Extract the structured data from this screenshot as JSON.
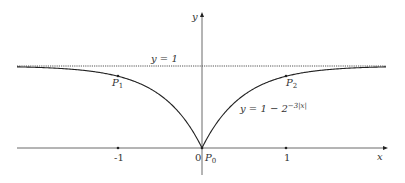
{
  "figure": {
    "axes": {
      "x_label": "x",
      "y_label": "y"
    },
    "asymptote_label": "y = 1",
    "curve_label": {
      "prefix": "y = 1 − 2",
      "exponent": "−3|x|"
    },
    "tick_labels": {
      "neg_one": "-1",
      "zero": "0",
      "one": "1"
    },
    "points": [
      {
        "name": "P",
        "sub": "1",
        "x": -1,
        "y": 0.875
      },
      {
        "name": "P",
        "sub": "2",
        "x": 1,
        "y": 0.875
      },
      {
        "name": "P",
        "sub": "0",
        "x": 0,
        "y": 0
      }
    ],
    "colors": {
      "curve": "#222222",
      "axis": "#444444",
      "asymptote": "#555555"
    }
  },
  "chart_data": {
    "type": "line",
    "title": "",
    "xlabel": "x",
    "ylabel": "y",
    "function": "y = 1 - 2^(-3|x|)",
    "asymptote": {
      "y": 1,
      "label": "y = 1",
      "style": "dotted"
    },
    "xlim": [
      -2.2,
      2.2
    ],
    "ylim": [
      0,
      1.6
    ],
    "x_ticks": [
      -1,
      0,
      1
    ],
    "series": [
      {
        "name": "y = 1 - 2^{-3|x|}",
        "x": [
          -2.2,
          -2,
          -1.5,
          -1,
          -0.75,
          -0.5,
          -0.25,
          0,
          0.25,
          0.5,
          0.75,
          1,
          1.5,
          2,
          2.2
        ],
        "values": [
          0.99,
          0.984,
          0.956,
          0.875,
          0.79,
          0.646,
          0.405,
          0,
          0.405,
          0.646,
          0.79,
          0.875,
          0.956,
          0.984,
          0.99
        ]
      }
    ],
    "annotations": [
      {
        "label": "P1",
        "x": -1,
        "y": 0.875
      },
      {
        "label": "P2",
        "x": 1,
        "y": 0.875
      },
      {
        "label": "P0",
        "x": 0,
        "y": 0
      }
    ],
    "grid": false,
    "legend": "none"
  }
}
